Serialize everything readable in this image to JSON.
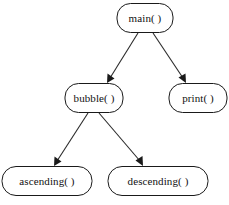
{
  "diagram": {
    "type": "call-hierarchy-tree",
    "background_color": "#ffffff",
    "node_fill_color": "#ffffff",
    "node_stroke_color": "#1a1a1a",
    "edge_color": "#2a2a2a",
    "text_color": "#111111",
    "nodes": [
      {
        "id": "main",
        "label": "main( )",
        "shape": "rounded-rectangle",
        "x": 145,
        "y": 18,
        "width": 56,
        "height": 29,
        "level": 0
      },
      {
        "id": "bubble",
        "label": "bubble( )",
        "shape": "rounded-rectangle",
        "x": 94,
        "y": 98,
        "width": 58,
        "height": 29,
        "level": 1
      },
      {
        "id": "print",
        "label": "print( )",
        "shape": "rounded-rectangle",
        "x": 198,
        "y": 98,
        "width": 58,
        "height": 29,
        "level": 1
      },
      {
        "id": "ascending",
        "label": "ascending( )",
        "shape": "rounded-rectangle",
        "x": 47,
        "y": 181,
        "width": 90,
        "height": 29,
        "level": 2
      },
      {
        "id": "descending",
        "label": "descending( )",
        "shape": "rounded-rectangle",
        "x": 158,
        "y": 181,
        "width": 100,
        "height": 29,
        "level": 2
      }
    ],
    "edges": [
      {
        "id": "main-to-bubble",
        "from": "main",
        "to": "bubble",
        "from_x": 138,
        "from_y": 33,
        "to_x": 107,
        "to_y": 83,
        "arrow": "filled-triangle"
      },
      {
        "id": "main-to-print",
        "from": "main",
        "to": "print",
        "from_x": 153,
        "from_y": 33,
        "to_x": 186,
        "to_y": 83,
        "arrow": "filled-triangle"
      },
      {
        "id": "bubble-to-ascending",
        "from": "bubble",
        "to": "ascending",
        "from_x": 88,
        "from_y": 113,
        "to_x": 54,
        "to_y": 166,
        "arrow": "filled-triangle"
      },
      {
        "id": "bubble-to-descending",
        "from": "bubble",
        "to": "descending",
        "from_x": 99,
        "from_y": 113,
        "to_x": 143,
        "to_y": 166,
        "arrow": "filled-triangle"
      }
    ]
  }
}
